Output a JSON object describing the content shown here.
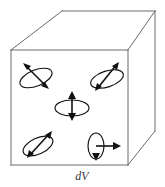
{
  "figure": {
    "kind": "physics-diagram",
    "caption": "dV",
    "caption_label": "dV",
    "width": 165,
    "height": 187,
    "colors": {
      "background": "#ffffff",
      "cube_edge": "#6b6b6b",
      "dipole_ink": "#111111",
      "caption_ink": "#3a3a3a"
    },
    "cube": {
      "name": "volume-element-cube",
      "front_face": {
        "left": 11,
        "top": 50,
        "right": 128,
        "bottom": 165
      },
      "depth_offset": {
        "dx": 27,
        "dy": -39
      },
      "edges": [
        {
          "name": "front-top",
          "from": [
            11,
            50
          ],
          "to": [
            128,
            50
          ]
        },
        {
          "name": "front-right",
          "from": [
            128,
            50
          ],
          "to": [
            128,
            165
          ]
        },
        {
          "name": "front-bottom",
          "from": [
            128,
            165
          ],
          "to": [
            11,
            165
          ]
        },
        {
          "name": "front-left",
          "from": [
            11,
            165
          ],
          "to": [
            11,
            50
          ]
        },
        {
          "name": "top-left-diagonal",
          "from": [
            11,
            50
          ],
          "to": [
            62,
            11
          ]
        },
        {
          "name": "top-back",
          "from": [
            62,
            11
          ],
          "to": [
            155,
            11
          ]
        },
        {
          "name": "top-right-diagonal",
          "from": [
            155,
            11
          ],
          "to": [
            128,
            50
          ]
        },
        {
          "name": "back-right-vertical",
          "from": [
            155,
            11
          ],
          "to": [
            155,
            131
          ]
        },
        {
          "name": "bottom-right-diagonal",
          "from": [
            128,
            165
          ],
          "to": [
            155,
            131
          ]
        }
      ]
    },
    "dipoles": [
      {
        "id": "dipole-upper-left",
        "label": "magnetic dipole upper left",
        "center": [
          36,
          78
        ],
        "loop": {
          "rx": 17,
          "ry": 8,
          "rotate": -22
        },
        "arrow": {
          "x1": 48,
          "y1": 88,
          "x2": 24,
          "y2": 64,
          "head_at": "both",
          "angle_deg": -45
        }
      },
      {
        "id": "dipole-upper-right",
        "label": "magnetic dipole upper right",
        "center": [
          107,
          78
        ],
        "loop": {
          "rx": 17,
          "ry": 8,
          "rotate": -18
        },
        "arrow": {
          "x1": 96,
          "y1": 88,
          "x2": 118,
          "y2": 62,
          "head_at": "both",
          "angle_deg": -50
        }
      },
      {
        "id": "dipole-center",
        "label": "magnetic dipole center",
        "center": [
          72,
          107
        ],
        "loop": {
          "rx": 17,
          "ry": 8,
          "rotate": 0
        },
        "arrow": {
          "x1": 72,
          "y1": 120,
          "x2": 72,
          "y2": 92,
          "head_at": "both",
          "angle_deg": -90
        }
      },
      {
        "id": "dipole-lower-left",
        "label": "magnetic dipole lower left",
        "center": [
          38,
          146
        ],
        "loop": {
          "rx": 16,
          "ry": 8,
          "rotate": -25
        },
        "arrow": {
          "x1": 28,
          "y1": 157,
          "x2": 51,
          "y2": 131,
          "head_at": "both",
          "angle_deg": -48
        }
      },
      {
        "id": "dipole-lower-right",
        "label": "magnetic dipole lower right",
        "center": [
          96,
          147
        ],
        "loop": {
          "rx": 8,
          "ry": 13,
          "rotate": 0
        },
        "arrow": {
          "x1": 96,
          "y1": 160,
          "x2": 120,
          "y2": 146,
          "head_at": "both",
          "angle_deg": 0
        }
      }
    ]
  }
}
